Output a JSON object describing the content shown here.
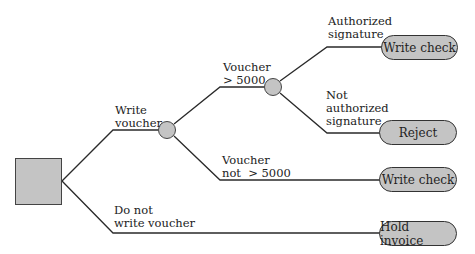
{
  "diagram": {
    "type": "decision-tree",
    "colors": {
      "node_fill": "#c4c4c4",
      "line": "#2a2a2a",
      "background": "#ffffff"
    },
    "nodes": {
      "root": {
        "shape": "square",
        "kind": "decision"
      },
      "chance_1": {
        "shape": "circle",
        "kind": "chance"
      },
      "chance_2": {
        "shape": "circle",
        "kind": "chance"
      }
    },
    "branches": {
      "write_voucher": {
        "line1": "Write",
        "line2": "voucher"
      },
      "do_not_write_voucher": {
        "line1": "Do not",
        "line2": "write voucher"
      },
      "voucher_gt_5000": {
        "line1": "Voucher",
        "line2": "> 5000"
      },
      "voucher_not_gt_5000": {
        "line1": "Voucher",
        "line2": "not  > 5000"
      },
      "authorized_signature": {
        "line1": "Authorized",
        "line2": "signature"
      },
      "not_authorized_signature": {
        "line1": "Not",
        "line2": "authorized",
        "line3": "signature"
      }
    },
    "outcomes": {
      "write_check_authorized": "Write check",
      "reject": "Reject",
      "write_check_small": "Write check",
      "hold_invoice": "Hold invoice"
    }
  }
}
